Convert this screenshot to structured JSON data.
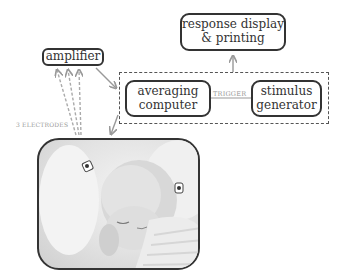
{
  "diagram": {
    "nodes": {
      "amplifier": "amplifier",
      "response_display_line1": "response display",
      "response_display_line2": "& printing",
      "averaging_computer_line1": "averaging",
      "averaging_computer_line2": "computer",
      "stimulus_generator_line1": "stimulus",
      "stimulus_generator_line2": "generator"
    },
    "labels": {
      "trigger": "TRIGGER",
      "electrodes": "3 ELECTRODES"
    },
    "image": {
      "description": "sleeping newborn baby with electrodes attached"
    },
    "colors": {
      "box_border": "#333333",
      "arrow": "#999999",
      "dashed_group": "#555555"
    }
  }
}
